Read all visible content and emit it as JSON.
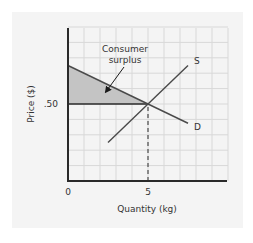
{
  "chart_data": {
    "type": "line",
    "title": "",
    "xlabel": "Quantity (kg)",
    "ylabel": "Price ($)",
    "xlim": [
      0,
      10
    ],
    "ylim": [
      0,
      1.0
    ],
    "grid": true,
    "x_ticks": [
      {
        "value": 0,
        "label": "0"
      },
      {
        "value": 5,
        "label": "5"
      }
    ],
    "y_ticks": [
      {
        "value": 0.5,
        "label": ".50"
      }
    ],
    "series": [
      {
        "name": "D",
        "label": "D",
        "points": [
          [
            0,
            0.75
          ],
          [
            7.5,
            0.375
          ]
        ]
      },
      {
        "name": "S",
        "label": "S",
        "points": [
          [
            2.5,
            0.25
          ],
          [
            7.5,
            0.75
          ]
        ]
      }
    ],
    "equilibrium": {
      "quantity": 5,
      "price": 0.5
    },
    "shaded_regions": [
      {
        "name": "Consumer surplus",
        "polygon": [
          [
            0,
            0.75
          ],
          [
            5,
            0.5
          ],
          [
            0,
            0.5
          ]
        ],
        "color": "#c4c4c4"
      }
    ],
    "annotations": [
      {
        "text_lines": [
          "Consumer",
          "surplus"
        ],
        "anchor": [
          2.0,
          0.95
        ],
        "arrow_to": [
          2.5,
          0.58
        ]
      }
    ],
    "reference_lines": [
      {
        "type": "horizontal",
        "y": 0.5,
        "x_from": 0,
        "x_to": 5,
        "style": "solid"
      },
      {
        "type": "vertical",
        "x": 5,
        "y_from": 0,
        "y_to": 0.5,
        "style": "dashed"
      }
    ],
    "colors": {
      "axis": "#2a2a2a",
      "grid": "#d8d8d8",
      "curve": "#4a4a4a",
      "shading": "#c4c4c4",
      "background": "#f4f4f4"
    }
  }
}
